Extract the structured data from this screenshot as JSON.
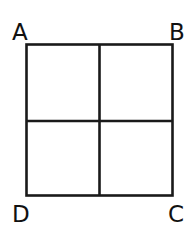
{
  "diagram": {
    "type": "square divided into four equal smaller squares",
    "corner_labels": {
      "top_left": "A",
      "top_right": "B",
      "bottom_right": "C",
      "bottom_left": "D"
    },
    "grid": {
      "rows": 2,
      "cols": 2
    },
    "colors": {
      "line": "#1a1a1a",
      "background": "#ffffff",
      "text": "#111111"
    }
  }
}
